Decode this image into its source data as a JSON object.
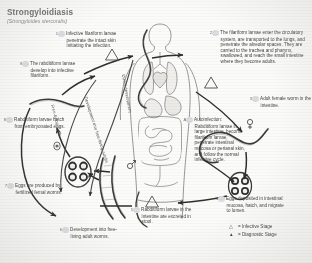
{
  "title": "Strongyloidiasis",
  "subtitle": "(Strongyloides stercoralis)",
  "steps": {
    "infective_penetrate": {
      "num": "1",
      "text": "Infective filariform larvae penetrate the intact skin initiating the infection."
    },
    "filariform_circulatory": {
      "num": "2",
      "text": "The filariform larvae enter the circulatory system, are transported to the lungs, and penetrate the alveolar spaces. They are carried to the trachea and pharynx, swallowed, and reach the small intestine where they become adults."
    },
    "adult_female": {
      "num": "3",
      "text": "Adult female worm in the intestine."
    },
    "eggs_deposited": {
      "num": "4",
      "text": "Eggs deposited in intestinal mucosa, hatch, and migrate to lumen."
    },
    "rabditiform_excreted": {
      "num": "5",
      "text": "Rabditiform larvae in the intestine are excreted in stool."
    },
    "development_free_living": {
      "num": "6",
      "text": "Development into free-living adult worms."
    },
    "eggs_produced": {
      "num": "7",
      "text": "Eggs are produced by fertilized femal worms."
    },
    "rabditiform_hatch": {
      "num": "8",
      "text": "Rabditiform larvae hatch from embryonated eggs."
    },
    "develop_into_filariform": {
      "num": "9",
      "text": "The rabditiform larvae develop into infective filariform."
    },
    "autoinfection": {
      "num": "A",
      "text": "Autoinfection: Rabditiform larvae in large intestine, become filariform larvae, penetrate intestinal mucosa or perianal skin, and follow the normal infective cycle."
    }
  },
  "arc_labels": {
    "development_into_free_living": "Development into free-living adults",
    "free_living_cycle": "Free-living cycle",
    "direct_development": "Direct development"
  },
  "legend": {
    "infective": {
      "glyph": "△",
      "label": "= Infective Stage"
    },
    "diagnostic": {
      "glyph": "▲",
      "label": "= Diagnostic Stage"
    }
  },
  "symbols": {
    "female": "♀",
    "male": "♂"
  },
  "colors": {
    "ink": "#3f3f3d",
    "title": "#6e6e6c",
    "badge": "#d9dde1",
    "paper": "#fbfbfa"
  }
}
